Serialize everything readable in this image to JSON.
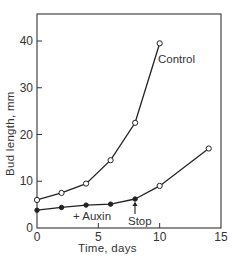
{
  "chart_data": {
    "type": "line",
    "title": "",
    "xlabel": "Time, days",
    "ylabel": "Bud length, mm",
    "xlim": [
      0,
      15
    ],
    "ylim": [
      0,
      45
    ],
    "xticks": [
      0,
      5,
      10,
      15
    ],
    "yticks": [
      0,
      10,
      20,
      30,
      40
    ],
    "grid": false,
    "legend": "none (inline labels)",
    "series": [
      {
        "name": "Control",
        "marker": "open-circle",
        "x": [
          0,
          2,
          4,
          6,
          8,
          10
        ],
        "values": [
          6,
          7.5,
          9.5,
          14.5,
          22.5,
          39.5
        ]
      },
      {
        "name": "+ Auxin",
        "marker": "filled-circle",
        "x": [
          0,
          2,
          4,
          6,
          8
        ],
        "values": [
          3.8,
          4.4,
          4.9,
          5.1,
          6.2
        ]
      },
      {
        "name": "After auxin stop",
        "marker": "open-circle",
        "x": [
          8,
          10,
          14
        ],
        "values": [
          6.2,
          9,
          17
        ]
      }
    ],
    "annotations": [
      {
        "text": "Control",
        "near_x": 10.5,
        "near_y": 35
      },
      {
        "text": "+ Auxin",
        "near_x": 4,
        "near_y": 2
      },
      {
        "text": "Stop",
        "at_x": 8,
        "arrow": "up"
      }
    ]
  },
  "labels": {
    "xlabel": "Time, days",
    "ylabel": "Bud length, mm",
    "control": "Control",
    "auxin": "+ Auxin",
    "stop": "Stop",
    "xticks": [
      "0",
      "5",
      "10",
      "15"
    ],
    "yticks": [
      "0",
      "10",
      "20",
      "30",
      "40"
    ]
  }
}
